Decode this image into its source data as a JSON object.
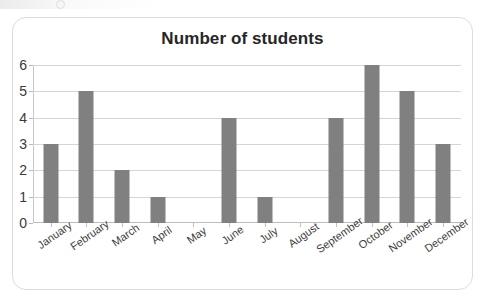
{
  "chart_data": {
    "type": "bar",
    "title": "Number of students",
    "xlabel": "",
    "ylabel": "",
    "categories": [
      "January",
      "February",
      "March",
      "April",
      "May",
      "June",
      "July",
      "August",
      "September",
      "October",
      "November",
      "December"
    ],
    "values": [
      3,
      5,
      2,
      1,
      0,
      4,
      1,
      0,
      4,
      6,
      5,
      3
    ],
    "series": [
      {
        "name": "Number of students",
        "values": [
          3,
          5,
          2,
          1,
          0,
          4,
          1,
          0,
          4,
          6,
          5,
          3
        ]
      }
    ],
    "ylim": [
      0,
      6
    ],
    "ytick_labels": [
      "0",
      "1",
      "2",
      "3",
      "4",
      "5",
      "6"
    ],
    "ytick_values": [
      0,
      1,
      2,
      3,
      4,
      5,
      6
    ],
    "grid": "horizontal",
    "legend": "none",
    "bar_color": "#808080",
    "gridline_color": "#d5d5d5",
    "title_color": "#262626",
    "xtick_label_rotation": "-35"
  },
  "card": {
    "border_color": "#dcdcdc"
  }
}
